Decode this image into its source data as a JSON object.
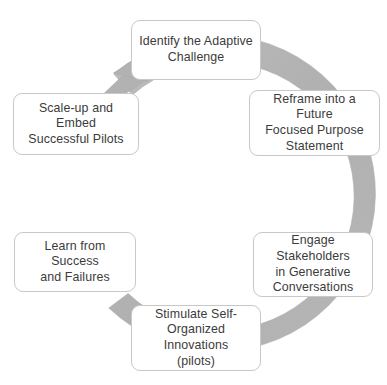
{
  "diagram": {
    "type": "cyclical-process",
    "direction": "clockwise",
    "colors": {
      "ring": "#b3b3b3",
      "ring_edge": "#a8a8a8",
      "box_border": "#c8c8c8",
      "box_fill": "#ffffff",
      "text": "#3b3b3b",
      "background": "#ffffff"
    },
    "ring": {
      "center_x": 191,
      "center_y": 196,
      "outer_radius": 158,
      "inner_radius": 134,
      "arrowhead_position": "top-left",
      "arrowhead_angle_deg": 212
    },
    "steps": [
      {
        "order": 1,
        "label": "Identify the Adaptive\nChallenge",
        "position": "top",
        "x": 131,
        "y": 20,
        "w": 130,
        "h": 60
      },
      {
        "order": 2,
        "label": "Reframe into a Future\nFocused  Purpose\nStatement",
        "position": "upper-right",
        "x": 249,
        "y": 90,
        "w": 131,
        "h": 66
      },
      {
        "order": 3,
        "label": "Engage Stakeholders\nin Generative\nConversations",
        "position": "lower-right",
        "x": 253,
        "y": 232,
        "w": 120,
        "h": 65
      },
      {
        "order": 4,
        "label": "Stimulate Self-\nOrganized Innovations\n(pilots)",
        "position": "bottom",
        "x": 131,
        "y": 305,
        "w": 130,
        "h": 66
      },
      {
        "order": 5,
        "label": "Learn from Success\nand Failures",
        "position": "lower-left",
        "x": 14,
        "y": 232,
        "w": 122,
        "h": 60
      },
      {
        "order": 6,
        "label": "Scale-up and Embed\nSuccessful Pilots",
        "position": "upper-left",
        "x": 13,
        "y": 93,
        "w": 126,
        "h": 62
      }
    ]
  }
}
